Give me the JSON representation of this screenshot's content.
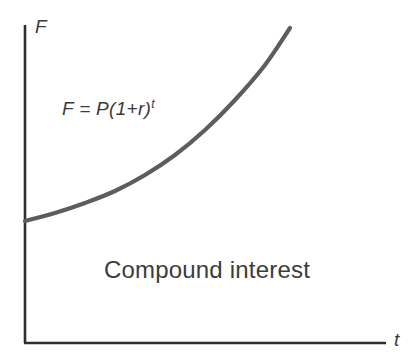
{
  "chart_data": {
    "type": "line",
    "title": "Compound interest",
    "xlabel": "t",
    "ylabel": "F",
    "annotation": "F = P(1+r)",
    "annotation_exponent": "t",
    "grid": false,
    "legend": false,
    "axes": {
      "x_origin_px": 25,
      "y_origin_px": 343,
      "x_end_px": 386,
      "y_top_px": 25,
      "xlim_label": "t",
      "ylim_label": "F"
    },
    "series": [
      {
        "name": "F = P(1+r)^t",
        "color": "#5d5d5d",
        "points_px": [
          [
            25,
            221
          ],
          [
            55,
            213
          ],
          [
            85,
            203
          ],
          [
            115,
            191
          ],
          [
            145,
            175
          ],
          [
            175,
            155
          ],
          [
            205,
            130
          ],
          [
            235,
            100
          ],
          [
            265,
            65
          ],
          [
            290,
            28
          ]
        ]
      }
    ]
  },
  "figure": {
    "background_color": "#ffffff",
    "axis_color": "#2e2e2e",
    "curve_color": "#5d5d5d",
    "text_color": "#3a3a3a",
    "caption_text": "Compound interest",
    "y_axis_label": "F",
    "x_axis_label": "t",
    "equation_base": "F = P(1+r)",
    "equation_exponent": "t"
  }
}
